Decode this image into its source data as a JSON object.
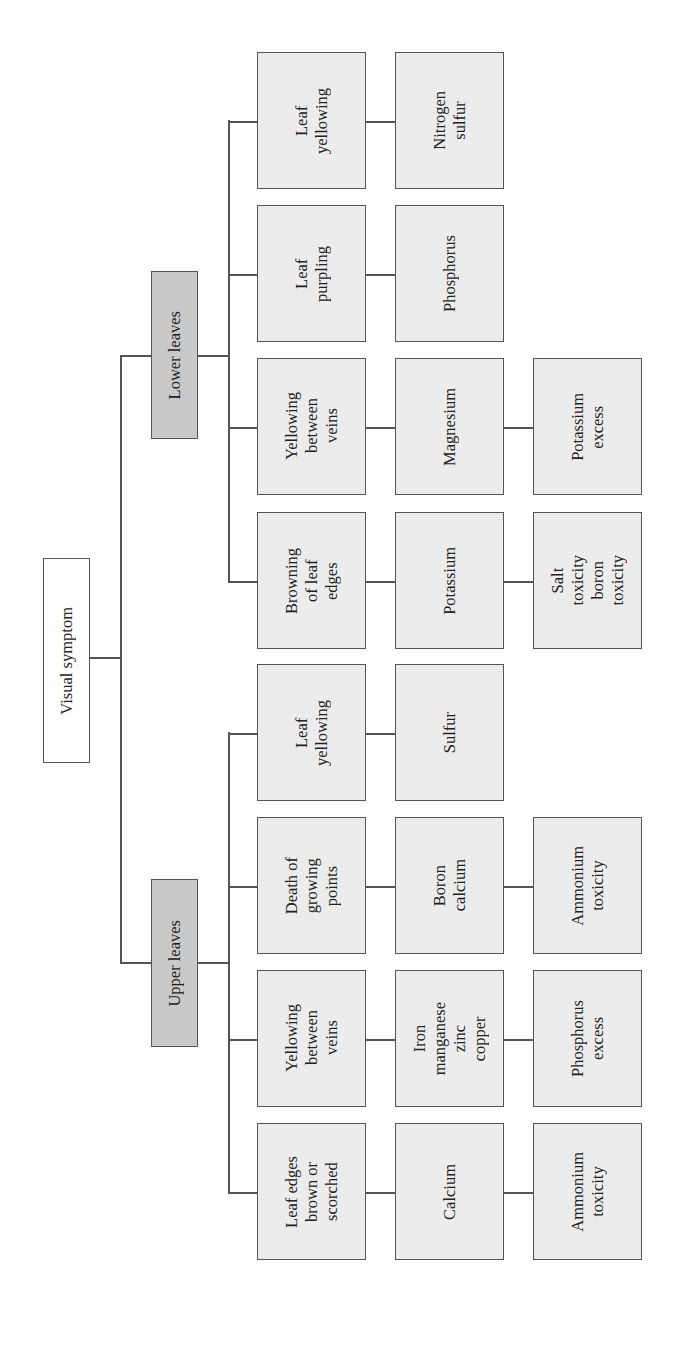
{
  "diagram": {
    "root": {
      "label": "Visual symptom"
    },
    "branches": [
      {
        "label": "Lower leaves",
        "rows": [
          {
            "symptom": "Leaf\nyellowing",
            "cause": "Nitrogen\nsulfur",
            "excess": null
          },
          {
            "symptom": "Leaf\npurpling",
            "cause": "Phosphorus",
            "excess": null
          },
          {
            "symptom": "Yellowing\nbetween\nveins",
            "cause": "Magnesium",
            "excess": "Potassium\nexcess"
          },
          {
            "symptom": "Browning\nof leaf\nedges",
            "cause": "Potassium",
            "excess": "Salt\ntoxicity\nboron\ntoxicity"
          }
        ]
      },
      {
        "label": "Upper leaves",
        "rows": [
          {
            "symptom": "Leaf\nyellowing",
            "cause": "Sulfur",
            "excess": null
          },
          {
            "symptom": "Death of\ngrowing\npoints",
            "cause": "Boron\ncalcium",
            "excess": "Ammonium\ntoxicity"
          },
          {
            "symptom": "Yellowing\nbetween\nveins",
            "cause": "Iron\nmanganese\nzinc\ncopper",
            "excess": "Phosphorus\nexcess"
          },
          {
            "symptom": "Leaf edges\nbrown or\nscorched",
            "cause": "Calcium",
            "excess": "Ammonium\ntoxicity"
          }
        ]
      }
    ]
  }
}
